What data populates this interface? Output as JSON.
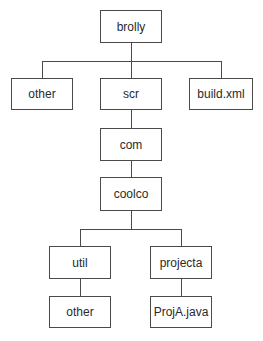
{
  "diagram": {
    "type": "directory-tree",
    "nodes": {
      "brolly": "brolly",
      "other_top": "other",
      "scr": "scr",
      "build_xml": "build.xml",
      "com": "com",
      "coolco": "coolco",
      "util": "util",
      "projecta": "projecta",
      "other_util": "other",
      "proja_java": "ProjA.java"
    },
    "edges": [
      [
        "brolly",
        "other_top"
      ],
      [
        "brolly",
        "scr"
      ],
      [
        "brolly",
        "build_xml"
      ],
      [
        "scr",
        "com"
      ],
      [
        "com",
        "coolco"
      ],
      [
        "coolco",
        "util"
      ],
      [
        "coolco",
        "projecta"
      ],
      [
        "util",
        "other_util"
      ],
      [
        "projecta",
        "proja_java"
      ]
    ]
  }
}
